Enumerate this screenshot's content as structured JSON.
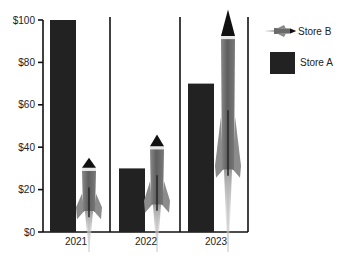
{
  "chart_data": {
    "type": "bar",
    "title": "",
    "xlabel": "",
    "ylabel": "",
    "categories": [
      "2021",
      "2022",
      "2023"
    ],
    "series": [
      {
        "name": "Store A",
        "style": "bar",
        "color": "#222222",
        "values": [
          100,
          30,
          70
        ]
      },
      {
        "name": "Store B",
        "style": "rocket-pictograph",
        "color": "#6e6e6e",
        "values": [
          35,
          46,
          105
        ]
      }
    ],
    "ylim": [
      0,
      100
    ],
    "yticks": [
      0,
      20,
      40,
      60,
      80,
      100
    ],
    "ytick_labels": [
      "$0",
      "$20",
      "$40",
      "$60",
      "$80",
      "$100"
    ],
    "grid": false,
    "legend_position": "right-top",
    "legend": [
      "Store B",
      "Store A"
    ]
  },
  "legend": {
    "store_b": "Store B",
    "store_a": "Store A"
  },
  "colors": {
    "bar": "#222222",
    "axis": "#111111",
    "rocket_body": "#6e6e6e",
    "rocket_nose": "#111111",
    "rocket_band": "#e8e8e8",
    "rocket_flame": "#bdbdbd"
  }
}
